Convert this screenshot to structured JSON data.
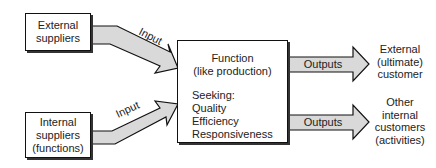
{
  "diagram": {
    "suppliers": [
      {
        "id": "external",
        "lines": [
          "External",
          "suppliers"
        ]
      },
      {
        "id": "internal",
        "lines": [
          "Internal",
          "suppliers",
          "(functions)"
        ]
      }
    ],
    "input_arrows": [
      {
        "label": "Input"
      },
      {
        "label": "Input"
      }
    ],
    "function_box": {
      "title_lines": [
        "Function",
        "(like production)"
      ],
      "seeking_label": "Seeking:",
      "goals": [
        "Quality",
        "Efficiency",
        "Responsiveness"
      ]
    },
    "output_arrows": [
      {
        "label": "Outputs"
      },
      {
        "label": "Outputs"
      }
    ],
    "customers": [
      {
        "id": "external",
        "lines": [
          "External",
          "(ultimate)",
          "customer"
        ]
      },
      {
        "id": "internal",
        "lines": [
          "Other",
          "internal",
          "customers",
          "(activities)"
        ]
      }
    ],
    "colors": {
      "arrow_fill": "#d9d9d9",
      "stroke": "#111111"
    }
  }
}
